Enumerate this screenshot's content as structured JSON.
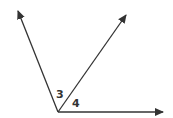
{
  "diagram": {
    "title": "",
    "vertex": {
      "x": 58,
      "y": 112
    },
    "rays": [
      {
        "name": "left-ray",
        "end": {
          "x": 18,
          "y": 11
        }
      },
      {
        "name": "middle-ray",
        "end": {
          "x": 126,
          "y": 15
        }
      },
      {
        "name": "right-ray",
        "end": {
          "x": 163,
          "y": 112
        }
      }
    ],
    "angle_labels": [
      {
        "text": "3",
        "x": 56,
        "y": 98
      },
      {
        "text": "4",
        "x": 72,
        "y": 107
      }
    ],
    "line_color": "#333333"
  }
}
